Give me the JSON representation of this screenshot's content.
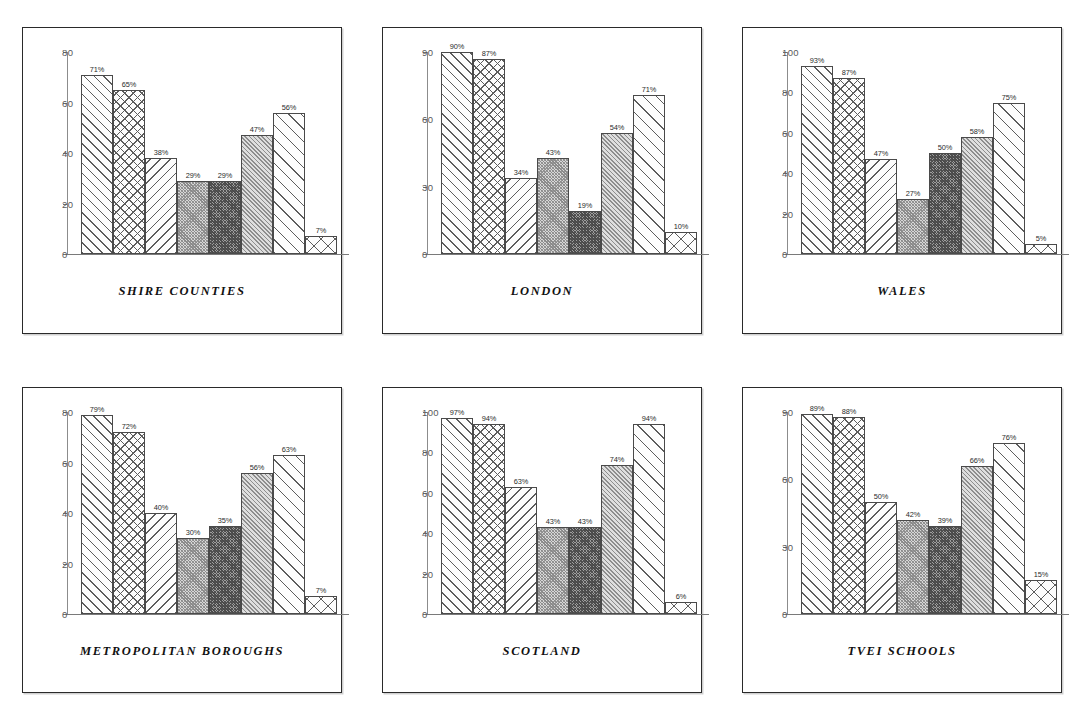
{
  "page": {
    "background": "#ffffff",
    "layout": "2 rows x 3 columns of bar-chart panels"
  },
  "chart_data": [
    {
      "type": "bar",
      "title": "SHIRE COUNTIES",
      "xlabel": "",
      "ylabel": "",
      "ylim": [
        0,
        80
      ],
      "yticks": [
        "0",
        "20",
        "40",
        "60",
        "80"
      ],
      "grid": false,
      "legend": "none",
      "categories": [
        "1",
        "2",
        "3",
        "4",
        "5",
        "6",
        "7",
        "8"
      ],
      "values": [
        71,
        65,
        38,
        29,
        29,
        47,
        56,
        7
      ],
      "data_labels": [
        "71%",
        "65%",
        "38%",
        "29%",
        "29%",
        "47%",
        "56%",
        "7%"
      ],
      "patterns": [
        "fdiag",
        "cross",
        "bdiag",
        "dense-med",
        "dense-dark",
        "dense-fdiag",
        "wide-fdiag",
        "bigcross"
      ]
    },
    {
      "type": "bar",
      "title": "LONDON",
      "xlabel": "",
      "ylabel": "",
      "ylim": [
        0,
        90
      ],
      "yticks": [
        "0",
        "30",
        "60",
        "90"
      ],
      "grid": false,
      "legend": "none",
      "categories": [
        "1",
        "2",
        "3",
        "4",
        "5",
        "6",
        "7",
        "8"
      ],
      "values": [
        90,
        87,
        34,
        43,
        19,
        54,
        71,
        10
      ],
      "data_labels": [
        "90%",
        "87%",
        "34%",
        "43%",
        "19%",
        "54%",
        "71%",
        "10%"
      ],
      "patterns": [
        "fdiag",
        "cross",
        "bdiag",
        "dense-med",
        "dense-dark",
        "dense-fdiag",
        "wide-fdiag",
        "bigcross"
      ]
    },
    {
      "type": "bar",
      "title": "WALES",
      "xlabel": "",
      "ylabel": "",
      "ylim": [
        0,
        100
      ],
      "yticks": [
        "0",
        "20",
        "40",
        "60",
        "80",
        "100"
      ],
      "grid": false,
      "legend": "none",
      "categories": [
        "1",
        "2",
        "3",
        "4",
        "5",
        "6",
        "7",
        "8"
      ],
      "values": [
        93,
        87,
        47,
        27,
        50,
        58,
        75,
        5
      ],
      "data_labels": [
        "93%",
        "87%",
        "47%",
        "27%",
        "50%",
        "58%",
        "75%",
        "5%"
      ],
      "patterns": [
        "fdiag",
        "cross",
        "bdiag",
        "dense-med",
        "dense-dark",
        "dense-fdiag",
        "wide-fdiag",
        "bigcross"
      ]
    },
    {
      "type": "bar",
      "title": "METROPOLITAN BOROUGHS",
      "xlabel": "",
      "ylabel": "",
      "ylim": [
        0,
        80
      ],
      "yticks": [
        "0",
        "20",
        "40",
        "60",
        "80"
      ],
      "grid": false,
      "legend": "none",
      "categories": [
        "1",
        "2",
        "3",
        "4",
        "5",
        "6",
        "7",
        "8"
      ],
      "values": [
        79,
        72,
        40,
        30,
        35,
        56,
        63,
        7
      ],
      "data_labels": [
        "79%",
        "72%",
        "40%",
        "30%",
        "35%",
        "56%",
        "63%",
        "7%"
      ],
      "patterns": [
        "fdiag",
        "cross",
        "bdiag",
        "dense-med",
        "dense-dark",
        "dense-fdiag",
        "wide-fdiag",
        "bigcross"
      ]
    },
    {
      "type": "bar",
      "title": "SCOTLAND",
      "xlabel": "",
      "ylabel": "",
      "ylim": [
        0,
        100
      ],
      "yticks": [
        "0",
        "20",
        "40",
        "60",
        "80",
        "100"
      ],
      "grid": false,
      "legend": "none",
      "categories": [
        "1",
        "2",
        "3",
        "4",
        "5",
        "6",
        "7",
        "8"
      ],
      "values": [
        97,
        94,
        63,
        43,
        43,
        74,
        94,
        6
      ],
      "data_labels": [
        "97%",
        "94%",
        "63%",
        "43%",
        "43%",
        "74%",
        "94%",
        "6%"
      ],
      "patterns": [
        "fdiag",
        "cross",
        "bdiag",
        "dense-med",
        "dense-dark",
        "dense-fdiag",
        "wide-fdiag",
        "bigcross"
      ]
    },
    {
      "type": "bar",
      "title": "TVEI SCHOOLS",
      "xlabel": "",
      "ylabel": "",
      "ylim": [
        0,
        90
      ],
      "yticks": [
        "0",
        "30",
        "60",
        "90"
      ],
      "grid": false,
      "legend": "none",
      "categories": [
        "1",
        "2",
        "3",
        "4",
        "5",
        "6",
        "7",
        "8"
      ],
      "values": [
        89,
        88,
        50,
        42,
        39,
        66,
        76,
        15
      ],
      "data_labels": [
        "89%",
        "88%",
        "50%",
        "42%",
        "39%",
        "66%",
        "76%",
        "15%"
      ],
      "patterns": [
        "fdiag",
        "cross",
        "bdiag",
        "dense-med",
        "dense-dark",
        "dense-fdiag",
        "wide-fdiag",
        "bigcross"
      ]
    }
  ]
}
